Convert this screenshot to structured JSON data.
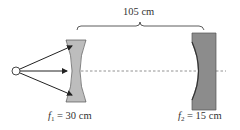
{
  "diagram": {
    "distance": {
      "text": "105 cm"
    },
    "lens": {
      "type": "diverging lens",
      "symbol": "f",
      "subscript": "1",
      "equals": " = ",
      "value": "30 cm"
    },
    "mirror": {
      "type": "concave mirror",
      "symbol": "f",
      "subscript": "2",
      "equals": " = ",
      "value": "15 cm"
    },
    "source": {
      "type": "point source"
    },
    "rays": {
      "count": 3
    },
    "colors": {
      "lens_fill": "#bdbdbd",
      "mirror_fill": "#8c8c8c",
      "stroke": "#333333",
      "axis": "#777777"
    }
  }
}
